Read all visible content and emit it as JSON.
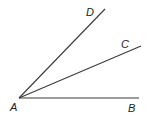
{
  "diagram": {
    "title": "",
    "type": "angles-from-common-vertex",
    "vertex": {
      "label": "A",
      "x": 19,
      "y": 98,
      "label_x": 10,
      "label_y": 111
    },
    "rays": [
      {
        "name": "AB",
        "label": "B",
        "end_x": 139,
        "end_y": 98,
        "label_x": 128,
        "label_y": 112
      },
      {
        "name": "AC",
        "label": "C",
        "end_x": 141,
        "end_y": 46,
        "label_x": 121,
        "label_y": 48
      },
      {
        "name": "AD",
        "label": "D",
        "end_x": 105,
        "end_y": 9,
        "label_x": 86,
        "label_y": 16
      }
    ],
    "colors": {
      "line": "#3a3a3a",
      "text": "#222222",
      "background": "#ffffff"
    }
  }
}
